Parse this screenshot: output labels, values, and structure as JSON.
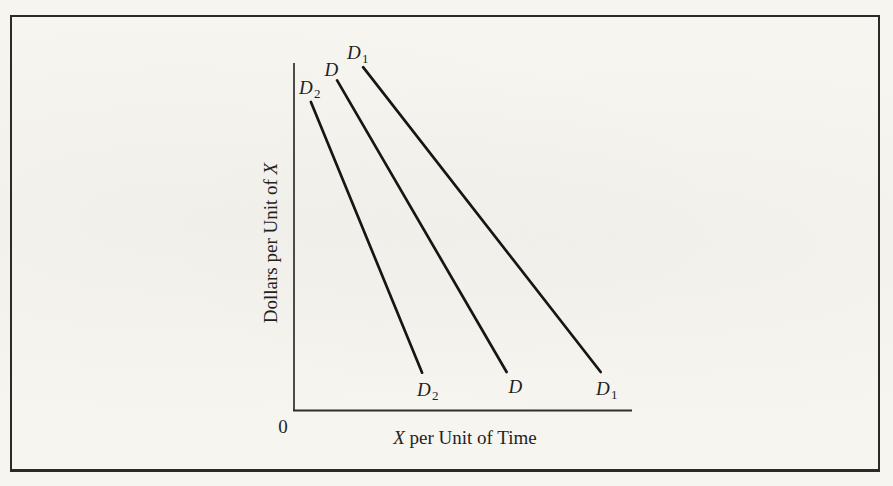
{
  "colors": {
    "paper": "#f6f5f0",
    "ink": "#1f1f1f",
    "frame": "#2a2a2a",
    "axis": "#2e2e2e",
    "curve": "#161616"
  },
  "chart_data": {
    "type": "line",
    "title": "",
    "xlabel": "X per Unit of Time",
    "ylabel": "Dollars per Unit of X",
    "xlabel_italic": "X",
    "xlabel_rest": " per Unit of Time",
    "ylabel_rest": "Dollars per Unit of ",
    "ylabel_italic": "X",
    "origin_label": "0",
    "grid": false,
    "legend": "none",
    "axis_ticks": "none",
    "coord_space": "points are [x,y] normalized to the plot area: x = 0 at origin to 1 at right end of x-axis, y = 0 at x-axis to 1 at top of y-axis",
    "series": [
      {
        "id": "D2",
        "label_main": "D",
        "label_sub": "2",
        "points": [
          [
            0.05,
            0.888
          ],
          [
            0.38,
            0.11
          ]
        ]
      },
      {
        "id": "D",
        "label_main": "D",
        "label_sub": "",
        "points": [
          [
            0.128,
            0.95
          ],
          [
            0.631,
            0.112
          ]
        ]
      },
      {
        "id": "D1",
        "label_main": "D",
        "label_sub": "1",
        "points": [
          [
            0.205,
            0.988
          ],
          [
            0.91,
            0.112
          ]
        ]
      }
    ]
  }
}
